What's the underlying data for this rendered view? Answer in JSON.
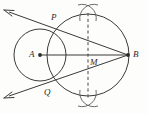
{
  "figure": {
    "width": 148,
    "height": 114,
    "background_color": "#fdfdfb",
    "stroke_color": "#3a3a3a",
    "label_color": "#2b2b2b"
  },
  "labels": {
    "A": "A",
    "B": "B",
    "P": "P",
    "Q": "Q",
    "M": "M"
  },
  "points": {
    "A": {
      "name": "A",
      "x": 40,
      "y": 55,
      "marked": true
    },
    "B": {
      "name": "B",
      "x": 128,
      "y": 55,
      "marked": true
    },
    "P": {
      "name": "P",
      "x": 56,
      "y": 24,
      "marked": false
    },
    "Q": {
      "name": "Q",
      "x": 54,
      "y": 87,
      "marked": false
    },
    "M": {
      "name": "M",
      "x": 88,
      "y": 55,
      "marked": false
    },
    "arc_cross_top": {
      "name": "arc-intersection-top",
      "x": 88,
      "y": 14,
      "marked": false
    },
    "arc_cross_bottom": {
      "name": "arc-intersection-bottom",
      "x": 88,
      "y": 97,
      "marked": false
    }
  },
  "circles": [
    {
      "name": "circle-A",
      "cx": 40,
      "cy": 55,
      "r": 26,
      "label": "small circle centred at A"
    },
    {
      "name": "circle-AB",
      "cx": 88,
      "cy": 55,
      "r": 41,
      "label": "large circle on diameter AB"
    }
  ],
  "segments": [
    {
      "name": "segment-AB",
      "x1": 40,
      "y1": 55,
      "x2": 128,
      "y2": 55,
      "style": "solid"
    },
    {
      "name": "segment-BP",
      "x1": 128,
      "y1": 55,
      "x2": 56,
      "y2": 24,
      "style": "solid"
    },
    {
      "name": "segment-BQ",
      "x1": 128,
      "y1": 55,
      "x2": 54,
      "y2": 87,
      "style": "solid"
    }
  ],
  "rays": [
    {
      "name": "ray-BP-extended",
      "from": "B",
      "through": "P",
      "arrow_x": 5,
      "arrow_y": 10,
      "style": "solid"
    },
    {
      "name": "ray-BQ-extended",
      "from": "B",
      "through": "Q",
      "arrow_x": 5,
      "arrow_y": 98,
      "style": "solid"
    }
  ],
  "dashed_line": {
    "name": "perpendicular-bisector-dashed",
    "x1": 88,
    "y1": 13,
    "x2": 88,
    "y2": 99,
    "style": "dashed",
    "passes_through": "M"
  },
  "construction_arcs": {
    "name": "compass-arc-marks",
    "count": 4,
    "description": "pairs of short compass arcs crossing above and below segment AB"
  }
}
